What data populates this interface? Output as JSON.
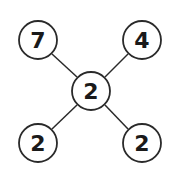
{
  "diagram": {
    "type": "number-puzzle-star",
    "center": {
      "value": "2",
      "cx": 91,
      "cy": 91
    },
    "nodes": [
      {
        "position": "top-left",
        "value": "7",
        "cx": 38,
        "cy": 40
      },
      {
        "position": "top-right",
        "value": "4",
        "cx": 142,
        "cy": 40
      },
      {
        "position": "bottom-left",
        "value": "2",
        "cx": 38,
        "cy": 143
      },
      {
        "position": "bottom-right",
        "value": "2",
        "cx": 142,
        "cy": 143
      }
    ],
    "radius": 19,
    "colors": {
      "stroke": "#2a2a2a",
      "fill": "#ffffff",
      "text": "#1a1a1a"
    }
  }
}
